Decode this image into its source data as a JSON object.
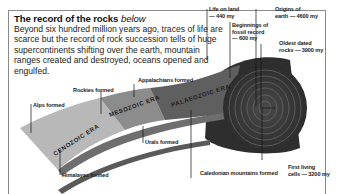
{
  "header": {
    "title": "The record of the rocks",
    "title_suffix": "below",
    "body": "Beyond six hundred million years ago, traces of life are scarce but the record of rock succession tells of huge supercontinents shifting over the earth, mountain ranges created and destroyed, oceans opened and engulfed."
  },
  "eras": [
    {
      "name": "CENOZOIC ERA",
      "color": "#b8b8b8"
    },
    {
      "name": "MESOZOIC ERA",
      "color": "#8c8c8c"
    },
    {
      "name": "PALAEOZOIC ERA",
      "color": "#5f5f5f"
    }
  ],
  "labels": {
    "alps": "Alps formed",
    "rockies": "Rockies formed",
    "appalachians": "Appalachians formed",
    "himalayas": "Himalayas formed",
    "urals": "Urals formed",
    "caledonian": "Caledonian mountains formed",
    "life_on_land": "Life on land\n— 440 my",
    "fossil_record": "Beginnings of\nfossil record\n— 600 my",
    "origins_earth": "Origins of\nearth — 4600 my",
    "oldest_rocks": "Oldest dated\nrocks — 3900 my",
    "first_cells": "First living\ncells — 3200 my"
  }
}
